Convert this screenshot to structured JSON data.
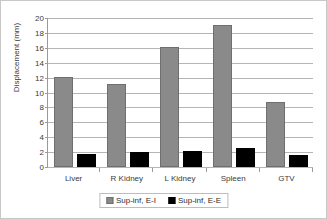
{
  "chart_data": {
    "type": "bar",
    "title": "",
    "xlabel": "",
    "ylabel": "Displacement (mm)",
    "categories": [
      "Liver",
      "R Kidney",
      "L Kidney",
      "Spleen",
      "GTV"
    ],
    "series": [
      {
        "name": "Sup-inf, E-I",
        "color": "#8a8a8a",
        "values": [
          12.1,
          11.2,
          16.1,
          19.0,
          8.7
        ]
      },
      {
        "name": "Sup-inf, E-E",
        "color": "#000000",
        "values": [
          1.7,
          2.0,
          2.2,
          2.5,
          1.6
        ]
      }
    ],
    "ylim": [
      0,
      20
    ],
    "ytick_values": [
      0,
      2,
      4,
      6,
      8,
      10,
      12,
      14,
      16,
      18,
      20
    ],
    "ytick_labels": [
      "0",
      "2",
      "4",
      "6",
      "8",
      "10",
      "12",
      "14",
      "16",
      "18",
      "20"
    ],
    "grid": "horizontal",
    "legend_position": "bottom",
    "legend_entries": [
      "Sup-inf, E-I",
      "Sup-inf, E-E"
    ]
  }
}
